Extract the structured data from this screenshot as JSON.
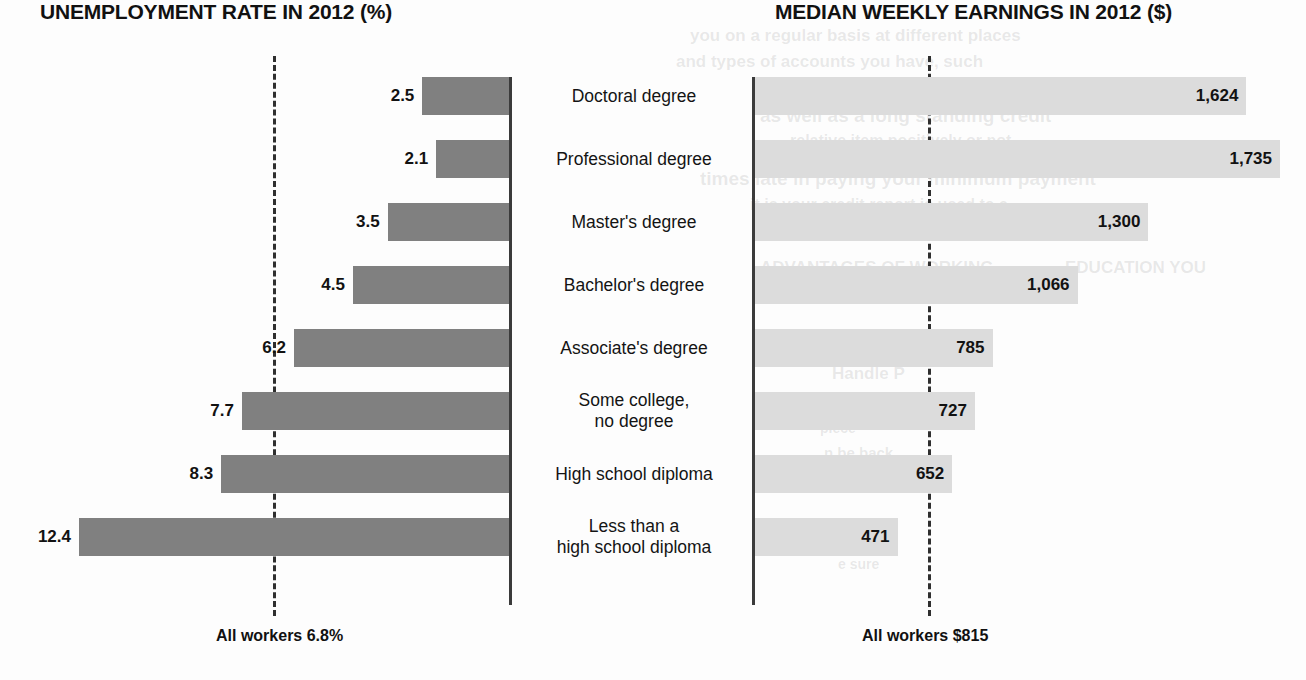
{
  "page": {
    "width": 1306,
    "height": 680,
    "background": "#fdfdfd"
  },
  "left_panel": {
    "title": "UNEMPLOYMENT RATE IN 2012 (%)",
    "footer": "All workers 6.8%"
  },
  "right_panel": {
    "title": "MEDIAN WEEKLY EARNINGS IN 2012 ($)",
    "footer": "All workers $815"
  },
  "categories": [
    "Doctoral degree",
    "Professional degree",
    "Master's degree",
    "Bachelor's degree",
    "Associate's degree",
    "Some college,\nno degree",
    "High school diploma",
    "Less than a\nhigh school diploma"
  ],
  "value_labels": {
    "unemployment": [
      "2.5",
      "2.1",
      "3.5",
      "4.5",
      "6.2",
      "7.7",
      "8.3",
      "12.4"
    ],
    "earnings": [
      "1,624",
      "1,735",
      "1,300",
      "1,066",
      "785",
      "727",
      "652",
      "471"
    ]
  },
  "colors": {
    "bar_dark": "#808080",
    "bar_light": "#dcdcdc",
    "axis": "#3b3b3b",
    "dashed_reference": "#2f2f2f",
    "text": "#111111"
  },
  "ghost_text": [
    {
      "text": "you on a regular basis at different places",
      "x": 690,
      "y": 26,
      "size": 17
    },
    {
      "text": "and types of accounts you have, such",
      "x": 676,
      "y": 52,
      "size": 17
    },
    {
      "text": "as well as a long standing credit",
      "x": 760,
      "y": 105,
      "size": 19
    },
    {
      "text": "relative item positively or not",
      "x": 790,
      "y": 132,
      "size": 16
    },
    {
      "text": "times late in paying your minimum payment",
      "x": 700,
      "y": 168,
      "size": 19
    },
    {
      "text": "it is your credit report is used to a",
      "x": 750,
      "y": 196,
      "size": 16
    },
    {
      "text": "ADVANTAGES OF WORKING",
      "x": 760,
      "y": 258,
      "size": 17
    },
    {
      "text": "EDUCATION YOU",
      "x": 1065,
      "y": 258,
      "size": 17
    },
    {
      "text": "Handle P",
      "x": 832,
      "y": 364,
      "size": 17
    },
    {
      "text": "piece",
      "x": 820,
      "y": 420,
      "size": 14
    },
    {
      "text": "n be back",
      "x": 824,
      "y": 444,
      "size": 15
    },
    {
      "text": "type of c",
      "x": 824,
      "y": 530,
      "size": 15
    },
    {
      "text": "e sure",
      "x": 838,
      "y": 556,
      "size": 14
    }
  ],
  "chart_data": [
    {
      "type": "bar",
      "orientation": "horizontal",
      "title": "UNEMPLOYMENT RATE IN 2012 (%)",
      "xlabel": "",
      "ylabel": "",
      "categories": [
        "Doctoral degree",
        "Professional degree",
        "Master's degree",
        "Bachelor's degree",
        "Associate's degree",
        "Some college, no degree",
        "High school diploma",
        "Less than a high school diploma"
      ],
      "values": [
        2.5,
        2.1,
        3.5,
        4.5,
        6.2,
        7.7,
        8.3,
        12.4
      ],
      "value_labels": [
        "2.5",
        "2.1",
        "3.5",
        "4.5",
        "6.2",
        "7.7",
        "8.3",
        "12.4"
      ],
      "xlim": [
        0,
        12.4
      ],
      "grid": false,
      "legend": "none",
      "reference_line": {
        "label": "All workers 6.8%",
        "value": 6.8,
        "style": "dashed"
      },
      "bar_color": "#808080",
      "direction": "right-to-left"
    },
    {
      "type": "bar",
      "orientation": "horizontal",
      "title": "MEDIAN WEEKLY EARNINGS IN 2012 ($)",
      "xlabel": "",
      "ylabel": "",
      "categories": [
        "Doctoral degree",
        "Professional degree",
        "Master's degree",
        "Bachelor's degree",
        "Associate's degree",
        "Some college, no degree",
        "High school diploma",
        "Less than a high school diploma"
      ],
      "values": [
        1624,
        1735,
        1300,
        1066,
        785,
        727,
        652,
        471
      ],
      "value_labels": [
        "1,624",
        "1,735",
        "1,300",
        "1,066",
        "785",
        "727",
        "652",
        "471"
      ],
      "xlim": [
        0,
        1735
      ],
      "grid": false,
      "legend": "none",
      "reference_line": {
        "label": "All workers $815",
        "value": 815,
        "style": "dashed"
      },
      "bar_color": "#dcdcdc",
      "direction": "left-to-right"
    }
  ]
}
